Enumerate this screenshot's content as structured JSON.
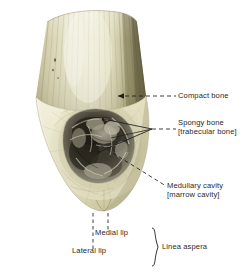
{
  "figure": {
    "background_color": "#ffffff",
    "text_color": "#2a2a2a"
  },
  "labels": {
    "compact_bone": "Compact bone",
    "spongy_bone": "Spongy bone",
    "spongy_bone_alt": "[trabecular bone]",
    "medullary_cavity": "Medullary cavity",
    "medullary_cavity_alt": "[marrow cavity]",
    "medial_lip": "Medial lip",
    "lateral_lip": "Lateral lip",
    "linea_aspera": "Linea aspera"
  },
  "colors": {
    "shaft_light": "#ddd9bc",
    "shaft_mid": "#c9c49c",
    "shaft_dark": "#8f8a63",
    "shaft_highlight": "#efecd8",
    "cut_face_light": "#efecd6",
    "cut_face_mid": "#ddd9b9",
    "cut_face_shadow": "#c2bd98",
    "cavity_dark": "#3b382f",
    "cavity_mid": "#6d6a5c",
    "spongy_grey": "#9a9688",
    "leader_line": "#1d1d1d"
  }
}
